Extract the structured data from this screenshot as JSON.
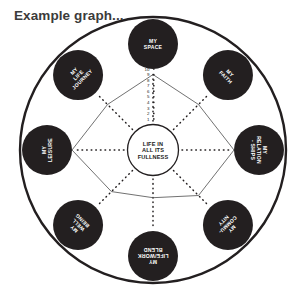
{
  "title": "Example graph...",
  "center": {
    "lines": [
      "LIFE IN",
      "ALL ITS",
      "FULLNESS"
    ]
  },
  "colors": {
    "bubble_fill": "#231f20",
    "bubble_text": "#ffffff",
    "outer_ring": "#231f20",
    "axis_line": "#231f20",
    "data_line": "#4d4d4d",
    "title_text": "#3b3b3b",
    "background": "#ffffff"
  },
  "axis": {
    "tick_labels": [
      "10",
      "9",
      "8",
      "7",
      "6",
      "5",
      "4",
      "3",
      "2",
      "1"
    ],
    "max": 10,
    "min": 0
  },
  "chart_data": {
    "type": "line",
    "subtype": "radar",
    "title": "Example graph...",
    "xlabel": "",
    "ylabel": "",
    "ylim": [
      0,
      10
    ],
    "grid": false,
    "legend": "none",
    "axis_tick_labels": [
      "10",
      "9",
      "8",
      "7",
      "6",
      "5",
      "4",
      "3",
      "2",
      "1"
    ],
    "center_label": "LIFE IN ALL ITS FULLNESS",
    "categories": [
      "MY SPACE",
      "MY FAITH",
      "MY RELATIONSHIPS",
      "MY COMMUNITY",
      "MY LIFE/WORK BLEND",
      "MY WELL BEING",
      "MY LEISURE",
      "MY LIFE JOURNEY"
    ],
    "values": [
      9,
      7,
      10,
      7,
      4,
      6,
      10,
      7
    ],
    "series": [
      {
        "name": "Example scores",
        "values": [
          9,
          7,
          10,
          7,
          4,
          6,
          10,
          7
        ]
      }
    ]
  },
  "spokes": [
    {
      "id": "my-space",
      "label_lines": [
        "MY",
        "SPACE"
      ],
      "angle_deg": -90,
      "rotation_deg": 0,
      "value": 9
    },
    {
      "id": "my-faith",
      "label_lines": [
        "MY",
        "FAITH"
      ],
      "angle_deg": -45,
      "rotation_deg": 45,
      "value": 7
    },
    {
      "id": "my-relationships",
      "label_lines": [
        "MY",
        "RELATION",
        "- SHIPS"
      ],
      "angle_deg": 0,
      "rotation_deg": 90,
      "value": 10
    },
    {
      "id": "my-community",
      "label_lines": [
        "MY",
        "COMMU-",
        "NITY"
      ],
      "angle_deg": 45,
      "rotation_deg": 135,
      "value": 7
    },
    {
      "id": "my-life-work-blend",
      "label_lines": [
        "MY",
        "LIFE/WORK",
        "BLEND"
      ],
      "angle_deg": 90,
      "rotation_deg": 180,
      "value": 4
    },
    {
      "id": "my-well-being",
      "label_lines": [
        "MY",
        "WELL",
        "BEING"
      ],
      "angle_deg": 135,
      "rotation_deg": 225,
      "value": 6
    },
    {
      "id": "my-leisure",
      "label_lines": [
        "MY",
        "LEISURE"
      ],
      "angle_deg": 180,
      "rotation_deg": 270,
      "value": 10
    },
    {
      "id": "my-life-journey",
      "label_lines": [
        "MY",
        "LIFE",
        "JOURNEY"
      ],
      "angle_deg": -135,
      "rotation_deg": 315,
      "value": 7
    }
  ]
}
